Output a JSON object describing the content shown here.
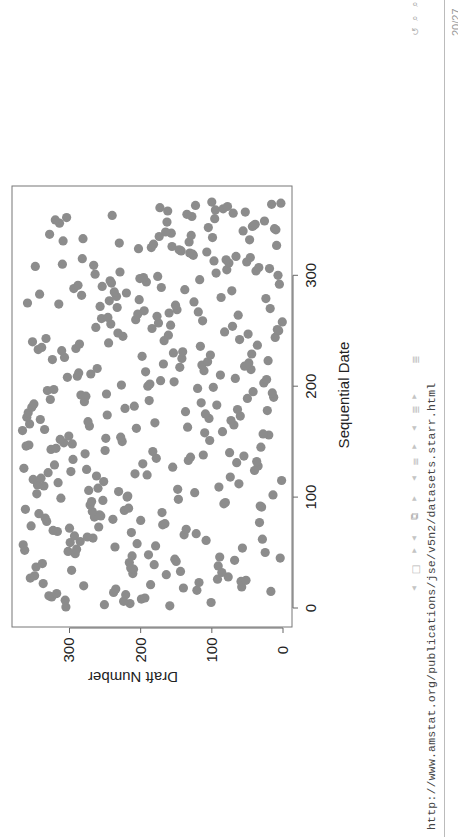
{
  "slide": {
    "url": "http://www.amstat.org/publications/jse/v5n2/datasets.starr.html",
    "page_number": "20/27",
    "nav_icons": [
      "frame-prev-next-icon",
      "slide-stack-icon",
      "section-icon",
      "subsection-icon",
      "doc-icon",
      "undo-icon",
      "search-icon",
      "zoom-icon"
    ]
  },
  "chart_data": {
    "type": "scatter",
    "title": "",
    "xlabel": "Sequential Date",
    "ylabel": "Draft Number",
    "xlim": [
      0,
      366
    ],
    "ylim": [
      0,
      366
    ],
    "xticks": [
      0,
      100,
      200,
      300
    ],
    "yticks": [
      0,
      100,
      200,
      300
    ],
    "grid": false,
    "legend": null,
    "orientation": "rotated 90 degrees counter-clockwise on page",
    "marker_color": "#8c8c8c",
    "x": "day of year 1..366 (index+1)",
    "y": [
      305,
      159,
      251,
      215,
      101,
      224,
      306,
      199,
      194,
      325,
      329,
      221,
      318,
      238,
      17,
      121,
      235,
      140,
      58,
      280,
      186,
      337,
      118,
      59,
      52,
      92,
      355,
      77,
      349,
      164,
      211,
      86,
      144,
      297,
      210,
      214,
      347,
      91,
      181,
      338,
      216,
      150,
      68,
      152,
      4,
      89,
      212,
      189,
      292,
      25,
      302,
      363,
      290,
      57,
      236,
      179,
      365,
      205,
      299,
      285,
      108,
      29,
      267,
      275,
      293,
      139,
      122,
      213,
      317,
      323,
      136,
      300,
      259,
      354,
      169,
      166,
      33,
      332,
      200,
      239,
      334,
      265,
      256,
      258,
      343,
      170,
      268,
      223,
      362,
      217,
      30,
      32,
      271,
      83,
      81,
      269,
      253,
      147,
      312,
      219,
      218,
      14,
      346,
      124,
      231,
      273,
      148,
      260,
      90,
      336,
      345,
      62,
      316,
      252,
      2,
      351,
      340,
      74,
      262,
      191,
      208,
      330,
      298,
      40,
      276,
      364,
      155,
      35,
      321,
      197,
      65,
      37,
      133,
      295,
      178,
      130,
      55,
      112,
      278,
      75,
      183,
      250,
      326,
      319,
      31,
      361,
      357,
      296,
      308,
      226,
      103,
      313,
      249,
      228,
      301,
      20,
      28,
      110,
      85,
      366,
      335,
      206,
      134,
      272,
      69,
      356,
      180,
      274,
      73,
      341,
      104,
      360,
      60,
      247,
      109,
      358,
      137,
      22,
      64,
      222,
      353,
      209,
      93,
      350,
      115,
      279,
      188,
      327,
      50,
      13,
      277,
      284,
      248,
      15,
      42,
      331,
      322,
      120,
      98,
      190,
      227,
      187,
      27,
      153,
      172,
      23,
      67,
      303,
      289,
      88,
      270,
      287,
      193,
      111,
      45,
      261,
      145,
      54,
      114,
      168,
      48,
      106,
      21,
      324,
      142,
      307,
      198,
      102,
      44,
      154,
      141,
      311,
      344,
      291,
      339,
      116,
      36,
      286,
      245,
      352,
      167,
      61,
      333,
      11,
      225,
      161,
      49,
      232,
      82,
      6,
      8,
      184,
      263,
      71,
      158,
      242,
      175,
      1,
      113,
      207,
      255,
      246,
      177,
      63,
      204,
      160,
      119,
      195,
      149,
      18,
      233,
      257,
      151,
      315,
      359,
      125,
      244,
      202,
      24,
      87,
      234,
      283,
      342,
      220,
      237,
      72,
      138,
      294,
      171,
      254,
      288,
      5,
      241,
      192,
      243,
      117,
      201,
      196,
      176,
      7,
      264,
      94,
      229,
      38,
      79,
      19,
      34,
      348,
      266,
      310,
      76,
      51,
      97,
      80,
      282,
      46,
      66,
      126,
      127,
      131,
      107,
      143,
      146,
      203,
      185,
      156,
      9,
      182,
      230,
      132,
      309,
      47,
      281,
      99,
      174,
      129,
      328,
      157,
      165,
      56,
      10,
      12,
      105,
      43,
      41,
      39,
      314,
      163,
      26,
      320,
      96,
      304,
      128,
      240,
      135,
      70,
      53,
      162,
      95,
      84,
      173,
      78,
      123,
      16,
      3,
      100
    ]
  }
}
